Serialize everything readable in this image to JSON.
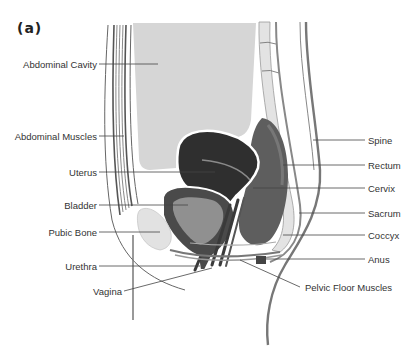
{
  "figure": {
    "panel_label": "(a)",
    "colors": {
      "cavity": "#d6d6d6",
      "uterus": "#2e2e2e",
      "bladder_outer": "#4a4a4a",
      "bladder_inner": "#8f8f8f",
      "rectum": "#5a5a5a",
      "bone": "#e2e2e2",
      "line": "#555555"
    },
    "labels_left": [
      {
        "id": "abdominal-cavity",
        "text": "Abdominal Cavity",
        "y": 64
      },
      {
        "id": "abdominal-muscles",
        "text": "Abdominal Muscles",
        "y": 136
      },
      {
        "id": "uterus",
        "text": "Uterus",
        "y": 172
      },
      {
        "id": "bladder",
        "text": "Bladder",
        "y": 205
      },
      {
        "id": "pubic-bone",
        "text": "Pubic Bone",
        "y": 232
      },
      {
        "id": "urethra",
        "text": "Urethra",
        "y": 266
      },
      {
        "id": "vagina",
        "text": "Vagina",
        "y": 291
      }
    ],
    "labels_right": [
      {
        "id": "spine",
        "text": "Spine",
        "y": 140
      },
      {
        "id": "rectum",
        "text": "Rectum",
        "y": 165
      },
      {
        "id": "cervix",
        "text": "Cervix",
        "y": 188
      },
      {
        "id": "sacrum",
        "text": "Sacrum",
        "y": 213
      },
      {
        "id": "coccyx",
        "text": "Coccyx",
        "y": 235
      },
      {
        "id": "anus",
        "text": "Anus",
        "y": 259
      },
      {
        "id": "pelvic-floor-muscles",
        "text": "Pelvic Floor Muscles",
        "y": 287
      }
    ]
  }
}
